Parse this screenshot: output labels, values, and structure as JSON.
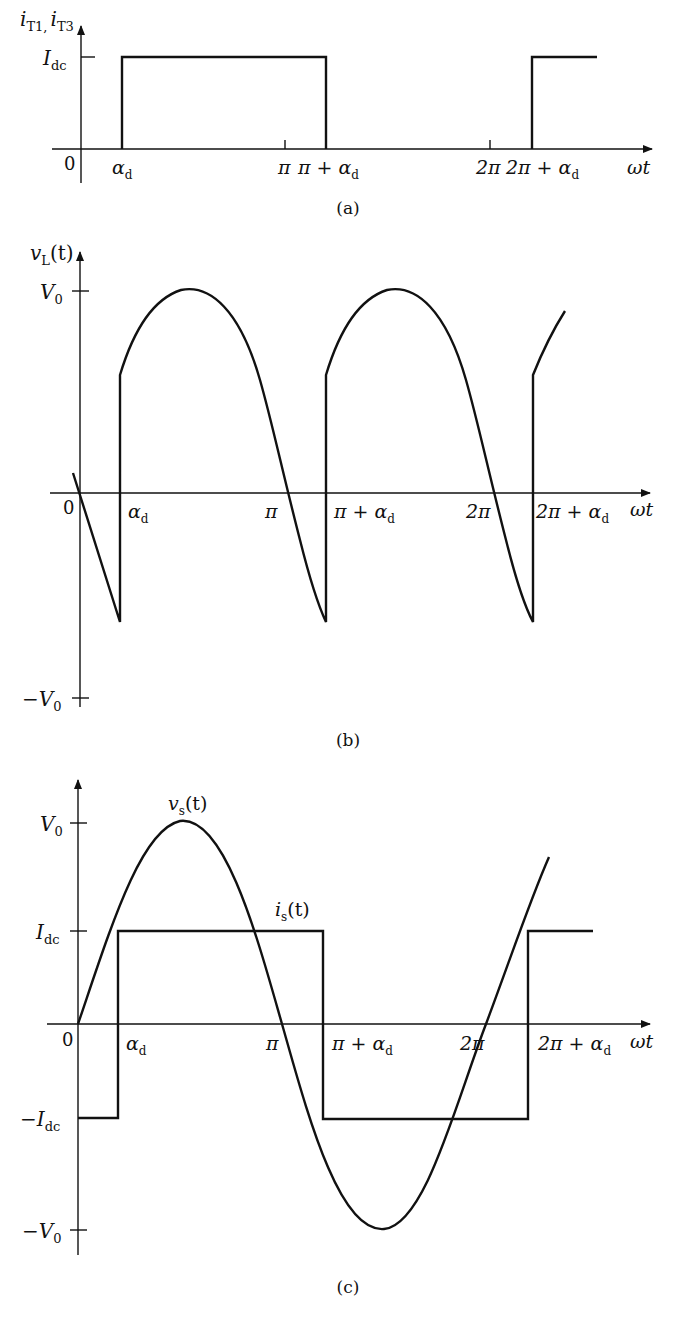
{
  "figure": {
    "panels": [
      {
        "id": "a",
        "caption": "(a)",
        "y_label_main": "i",
        "y_label_sub1": "T1,",
        "y_label_main2": "i",
        "y_label_sub2": "T3",
        "x_label": "ωt",
        "y_ticks": [
          {
            "main": "I",
            "sub": "dc"
          }
        ],
        "origin_label": "0",
        "x_ticks": [
          {
            "main": "α",
            "sub": "d"
          },
          {
            "main": "π",
            "sub": ""
          },
          {
            "main": "π + α",
            "sub": "d"
          },
          {
            "main": "2π",
            "sub": ""
          },
          {
            "main": "2π + α",
            "sub": "d"
          }
        ]
      },
      {
        "id": "b",
        "caption": "(b)",
        "y_label_main": "v",
        "y_label_sub": "L",
        "y_label_tail": "(t)",
        "x_label": "ωt",
        "y_ticks": [
          {
            "main": "V",
            "sub": "0"
          },
          {
            "main": "−V",
            "sub": "0"
          }
        ],
        "origin_label": "0",
        "x_ticks": [
          {
            "main": "α",
            "sub": "d"
          },
          {
            "main": "π",
            "sub": ""
          },
          {
            "main": "π + α",
            "sub": "d"
          },
          {
            "main": "2π",
            "sub": ""
          },
          {
            "main": "2π + α",
            "sub": "d"
          }
        ]
      },
      {
        "id": "c",
        "caption": "(c)",
        "x_label": "ωt",
        "curve_labels": [
          {
            "main": "v",
            "sub": "s",
            "tail": "(t)"
          },
          {
            "main": "i",
            "sub": "s",
            "tail": "(t)"
          }
        ],
        "y_ticks": [
          {
            "main": "V",
            "sub": "0"
          },
          {
            "main": "I",
            "sub": "dc"
          },
          {
            "main": "−I",
            "sub": "dc"
          },
          {
            "main": "−V",
            "sub": "0"
          }
        ],
        "origin_label": "0",
        "x_ticks": [
          {
            "main": "α",
            "sub": "d"
          },
          {
            "main": "π",
            "sub": ""
          },
          {
            "main": "π + α",
            "sub": "d"
          },
          {
            "main": "2π",
            "sub": ""
          },
          {
            "main": "2π + α",
            "sub": "d"
          }
        ]
      }
    ]
  }
}
